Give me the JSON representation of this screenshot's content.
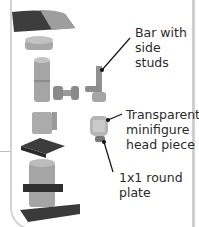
{
  "diagram": {
    "type": "lego-exploded-assembly",
    "labels": [
      {
        "id": "bar",
        "lines": [
          "Bar with",
          "side",
          "studs"
        ]
      },
      {
        "id": "head",
        "lines": [
          "Transparent",
          "minifigure",
          "head piece"
        ]
      },
      {
        "id": "plate",
        "lines": [
          "1x1 round",
          "plate"
        ]
      }
    ],
    "colors": {
      "light_gray": "#a7a7a7",
      "dark_gray": "#555555",
      "dark_slate": "#3a3a3a",
      "leader_line": "#111111"
    }
  }
}
